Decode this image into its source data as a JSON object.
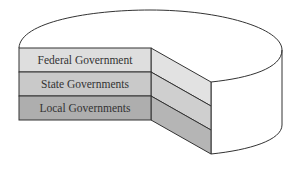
{
  "diagram": {
    "type": "layered-cake",
    "layers": [
      {
        "label": "Federal Government",
        "color": "#dedede",
        "side_color": "#e2e2e2"
      },
      {
        "label": "State Governments",
        "color": "#c9c9c9",
        "side_color": "#cfcfcf"
      },
      {
        "label": "Local Governments",
        "color": "#aeaeae",
        "side_color": "#b5b5b5"
      }
    ],
    "stroke": "#333333"
  }
}
